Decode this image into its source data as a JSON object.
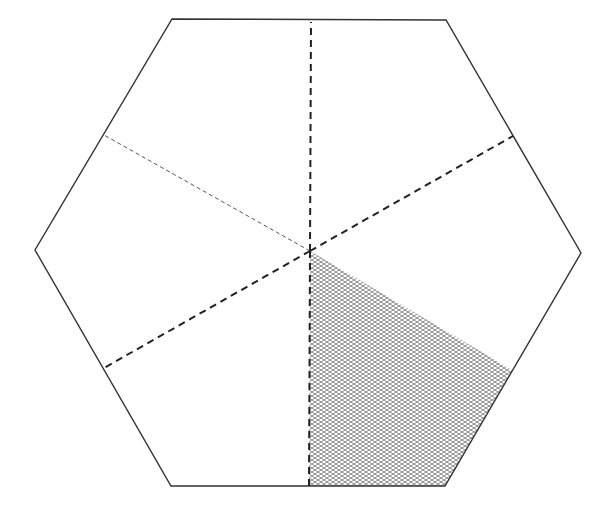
{
  "figure": {
    "shape": "regular hexagon",
    "total_parts": 6,
    "shaded_parts": 1,
    "fraction_shaded": "1/6"
  },
  "colors": {
    "outline": "#333333",
    "dashed": "#222222",
    "hatch": "#888888",
    "background": "#ffffff"
  },
  "geometry": {
    "center": [
      310,
      251
    ],
    "vertices": [
      [
        172,
        19
      ],
      [
        446,
        20
      ],
      [
        581,
        253
      ],
      [
        445,
        486
      ],
      [
        171,
        486
      ],
      [
        35,
        250
      ]
    ],
    "dividers": [
      {
        "from": [
          310,
          251
        ],
        "to": [
          311,
          22
        ],
        "style": "dashed-bold"
      },
      {
        "from": [
          310,
          251
        ],
        "to": [
          513,
          136
        ],
        "style": "dashed-bold"
      },
      {
        "from": [
          310,
          251
        ],
        "to": [
          104,
          135
        ],
        "style": "dashed-thin"
      },
      {
        "from": [
          310,
          251
        ],
        "to": [
          104,
          368
        ],
        "style": "dashed-bold"
      },
      {
        "from": [
          310,
          251
        ],
        "to": [
          309,
          486
        ],
        "style": "dashed-bold"
      }
    ],
    "shaded_region": [
      [
        310,
        251
      ],
      [
        512,
        370
      ],
      [
        445,
        486
      ],
      [
        309,
        486
      ]
    ]
  }
}
